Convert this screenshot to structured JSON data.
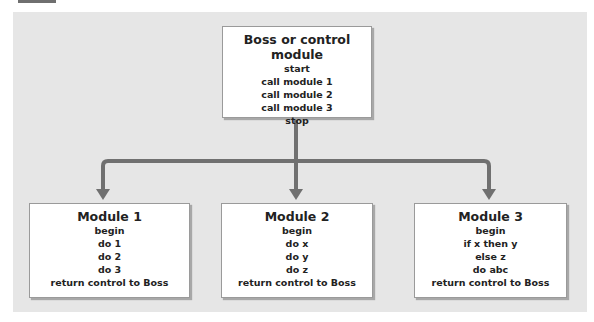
{
  "diagram": {
    "boss": {
      "title": "Boss or control module",
      "lines": [
        "start",
        "call module 1",
        "call module 2",
        "call module 3",
        "stop"
      ]
    },
    "modules": [
      {
        "title": "Module 1",
        "lines": [
          "begin",
          "do 1",
          "do 2",
          "do 3",
          "return control to Boss"
        ]
      },
      {
        "title": "Module 2",
        "lines": [
          "begin",
          "do x",
          "do y",
          "do z",
          "return control to Boss"
        ]
      },
      {
        "title": "Module 3",
        "lines": [
          "begin",
          "if x then y",
          "else z",
          "do abc",
          "return control to Boss"
        ]
      }
    ],
    "colors": {
      "panel": "#e6e6e6",
      "box": "#ffffff",
      "arrow": "#707070"
    }
  }
}
